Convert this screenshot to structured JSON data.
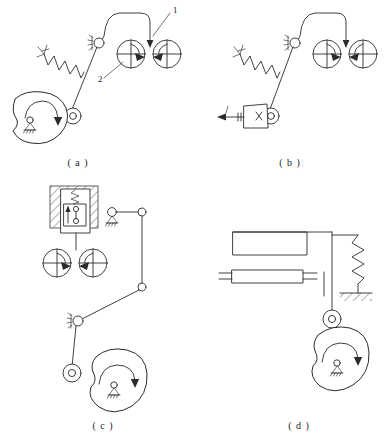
{
  "figure": {
    "title": "",
    "background": "#ffffff",
    "stroke_color": "#2b2b2b",
    "width": 390,
    "height": 439
  },
  "panels": [
    {
      "id": "a",
      "caption": "( a )",
      "callouts": [
        {
          "text": "1",
          "meaning": "cam-follower-link-1"
        },
        {
          "text": "2",
          "meaning": "rotation-indicator-2"
        }
      ],
      "elements": [
        "cam-blob",
        "fixed-pivot-ground",
        "rotation-arrow",
        "roller-follower",
        "spring",
        "rocker-link",
        "pivot-joint-ground",
        "curved-output-link",
        "arrowhead",
        "rotation-circle-right",
        "rotation-circle-left"
      ]
    },
    {
      "id": "b",
      "caption": "( b )",
      "callouts": [],
      "elements": [
        "slider-block",
        "slider-cross-mark",
        "input-force-arrow",
        "roller-follower",
        "spring",
        "rocker-link",
        "pivot-joint-ground",
        "curved-output-link",
        "arrowhead",
        "rotation-circle-right",
        "rotation-circle-left"
      ]
    },
    {
      "id": "c",
      "caption": "( c )",
      "callouts": [],
      "elements": [
        "hatched-wall",
        "valve-body-box",
        "valve-spring",
        "valve-spool",
        "valve-up-arrow",
        "rotation-circle-right",
        "rotation-circle-left",
        "pivot-joint-ground",
        "link-bar-top",
        "link-bar-vertical",
        "link-joint-upper",
        "link-joint-lower",
        "link-bar-diagonal",
        "rocker-pivot-ground",
        "rocker-link",
        "roller-follower",
        "cam-blob",
        "fixed-pivot-ground",
        "rotation-arrow"
      ]
    },
    {
      "id": "d",
      "caption": "( d )",
      "callouts": [],
      "elements": [
        "upper-bar",
        "lower-bar",
        "lower-bar-end-marks",
        "vertical-rod",
        "guide-mark",
        "return-spring",
        "spring-ground-hatch",
        "roller-follower",
        "cam-blob",
        "fixed-pivot-ground",
        "rotation-arrow"
      ]
    }
  ],
  "symbols": {
    "rotation_circle": "circle-with-crosshair-and-arrow",
    "fixed_pivot": "circle-on-hatched-triangle",
    "roller": "concentric-circles",
    "spring": "zigzag",
    "hatching": "diagonal-45-lines"
  }
}
